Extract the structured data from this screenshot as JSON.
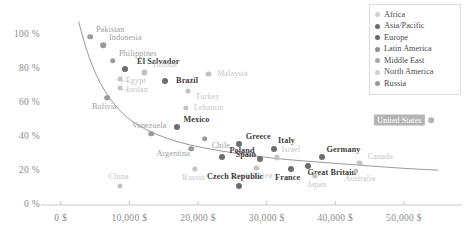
{
  "chart_data": {
    "type": "scatter",
    "title": "",
    "subtitle": "",
    "xlabel": "",
    "ylabel": "",
    "xlim": [
      -2000,
      57000
    ],
    "ylim": [
      0,
      110
    ],
    "grid": false,
    "legend_position": "top-right",
    "xticks": [
      "0 $",
      "10,000 $",
      "20,000 $",
      "30,000 $",
      "40,000 $",
      "50,000 $"
    ],
    "xtick_values": [
      0,
      10000,
      20000,
      30000,
      40000,
      50000
    ],
    "yticks": [
      "0 %",
      "20 %",
      "40 %",
      "60 %",
      "80 %",
      "100 %"
    ],
    "ytick_values": [
      0,
      20,
      40,
      60,
      80,
      100
    ],
    "legend": [
      {
        "label": "Africa",
        "color": "#cfcfcf"
      },
      {
        "label": "Asia/Pacific",
        "color": "#6b6b6b"
      },
      {
        "label": "Europe",
        "color": "#6b6b6b"
      },
      {
        "label": "Latin America",
        "color": "#8f8f8f"
      },
      {
        "label": "Middle East",
        "color": "#a8a8a8"
      },
      {
        "label": "North America",
        "color": "#cfcfcf"
      },
      {
        "label": "Russia",
        "color": "#9a9a9a"
      }
    ],
    "trendline": {
      "label": "fitted curve",
      "points": [
        [
          2600,
          108
        ],
        [
          3400,
          96
        ],
        [
          4200,
          86
        ],
        [
          5200,
          76
        ],
        [
          6400,
          67
        ],
        [
          8000,
          58
        ],
        [
          10000,
          50
        ],
        [
          12500,
          44
        ],
        [
          15500,
          39
        ],
        [
          19000,
          35
        ],
        [
          23000,
          32
        ],
        [
          27000,
          29.5
        ],
        [
          31000,
          27.5
        ],
        [
          35000,
          26
        ],
        [
          40000,
          24.5
        ],
        [
          45000,
          23
        ],
        [
          50000,
          21.5
        ],
        [
          55000,
          20.5
        ]
      ]
    },
    "points": [
      {
        "name": "Pakistan",
        "x": 4300,
        "y": 99,
        "region": "Asia/Pacific",
        "label_dx": 20,
        "label_dy": -7,
        "emphasis": "mid"
      },
      {
        "name": "Indonesia",
        "x": 6200,
        "y": 94,
        "region": "Asia/Pacific",
        "label_dx": 22,
        "label_dy": -7,
        "emphasis": "mid"
      },
      {
        "name": "Philippines",
        "x": 7600,
        "y": 85,
        "region": "Asia/Pacific",
        "label_dx": 25,
        "label_dy": -7,
        "emphasis": "mid"
      },
      {
        "name": "El Salvador",
        "x": 9400,
        "y": 80,
        "region": "Latin America",
        "label_dx": 33,
        "label_dy": -7,
        "emphasis": "high"
      },
      {
        "name": "Tunisia",
        "x": 12200,
        "y": 78,
        "region": "Middle East",
        "label_dx": 20,
        "label_dy": -7,
        "emphasis": "low"
      },
      {
        "name": "Egypt",
        "x": 8600,
        "y": 74,
        "region": "Middle East",
        "label_dx": 16,
        "label_dy": 2,
        "emphasis": "low"
      },
      {
        "name": "Jordan",
        "x": 8600,
        "y": 69,
        "region": "Middle East",
        "label_dx": 17,
        "label_dy": 2,
        "emphasis": "low"
      },
      {
        "name": "Brazil",
        "x": 15200,
        "y": 73,
        "region": "Latin America",
        "label_dx": 22,
        "label_dy": 0,
        "emphasis": "high"
      },
      {
        "name": "Malaysia",
        "x": 21500,
        "y": 77,
        "region": "Asia/Pacific",
        "label_dx": 24,
        "label_dy": 0,
        "emphasis": "low"
      },
      {
        "name": "Turkey",
        "x": 18500,
        "y": 67,
        "region": "Middle East",
        "label_dx": 20,
        "label_dy": 6,
        "emphasis": "low"
      },
      {
        "name": "Bolivia",
        "x": 6800,
        "y": 63,
        "region": "Latin America",
        "label_dx": -3,
        "label_dy": 9,
        "emphasis": "mid"
      },
      {
        "name": "Lebanon",
        "x": 18200,
        "y": 57,
        "region": "Middle East",
        "label_dx": 23,
        "label_dy": 0,
        "emphasis": "low"
      },
      {
        "name": "Mexico",
        "x": 17000,
        "y": 46,
        "region": "Latin America",
        "label_dx": 19,
        "label_dy": -7,
        "emphasis": "high"
      },
      {
        "name": "Venezuela",
        "x": 13200,
        "y": 42,
        "region": "Latin America",
        "label_dx": -2,
        "label_dy": -8,
        "emphasis": "mid"
      },
      {
        "name": "Chile",
        "x": 21000,
        "y": 39,
        "region": "Latin America",
        "label_dx": 16,
        "label_dy": 7,
        "emphasis": "mid"
      },
      {
        "name": "Argentina",
        "x": 19000,
        "y": 33,
        "region": "Latin America",
        "label_dx": -18,
        "label_dy": 5,
        "emphasis": "mid"
      },
      {
        "name": "Greece",
        "x": 26000,
        "y": 36,
        "region": "Europe",
        "label_dx": 19,
        "label_dy": -7,
        "emphasis": "high"
      },
      {
        "name": "Poland",
        "x": 23500,
        "y": 28,
        "region": "Europe",
        "label_dx": 20,
        "label_dy": -6,
        "emphasis": "high"
      },
      {
        "name": "Italy",
        "x": 31000,
        "y": 33,
        "region": "Europe",
        "label_dx": 13,
        "label_dy": -8,
        "emphasis": "high"
      },
      {
        "name": "Spain",
        "x": 29000,
        "y": 27,
        "region": "Europe",
        "label_dx": -14,
        "label_dy": -4,
        "emphasis": "high"
      },
      {
        "name": "Israel",
        "x": 31500,
        "y": 28,
        "region": "Middle East",
        "label_dx": 14,
        "label_dy": -7,
        "emphasis": "low"
      },
      {
        "name": "Germany",
        "x": 38000,
        "y": 28,
        "region": "Europe",
        "label_dx": 22,
        "label_dy": -7,
        "emphasis": "high"
      },
      {
        "name": "South Korea",
        "x": 28500,
        "y": 22,
        "region": "Asia/Pacific",
        "label_dx": -5,
        "label_dy": 8,
        "emphasis": "low"
      },
      {
        "name": "France",
        "x": 33500,
        "y": 21,
        "region": "Europe",
        "label_dx": -3,
        "label_dy": 9,
        "emphasis": "high"
      },
      {
        "name": "Great Britain",
        "x": 36000,
        "y": 23,
        "region": "Europe",
        "label_dx": 24,
        "label_dy": 7,
        "emphasis": "high"
      },
      {
        "name": "Japan",
        "x": 37000,
        "y": 17,
        "region": "Asia/Pacific",
        "label_dx": 2,
        "label_dy": 9,
        "emphasis": "low"
      },
      {
        "name": "Russia",
        "x": 19500,
        "y": 21,
        "region": "Russia",
        "label_dx": -1,
        "label_dy": 9,
        "emphasis": "low"
      },
      {
        "name": "China",
        "x": 8600,
        "y": 11,
        "region": "Asia/Pacific",
        "label_dx": -1,
        "label_dy": -9,
        "emphasis": "low"
      },
      {
        "name": "Czech Republic",
        "x": 26000,
        "y": 11,
        "region": "Europe",
        "label_dx": -4,
        "label_dy": -9,
        "emphasis": "high"
      },
      {
        "name": "Canada",
        "x": 43500,
        "y": 25,
        "region": "North America",
        "label_dx": 21,
        "label_dy": -6,
        "emphasis": "low"
      },
      {
        "name": "Australia",
        "x": 43000,
        "y": 20,
        "region": "Asia/Pacific",
        "label_dx": 4,
        "label_dy": 8,
        "emphasis": "low"
      },
      {
        "name": "United States",
        "x": 54000,
        "y": 50,
        "region": "North America",
        "label_dx": -32,
        "label_dy": 0,
        "emphasis": "highlight"
      }
    ]
  }
}
